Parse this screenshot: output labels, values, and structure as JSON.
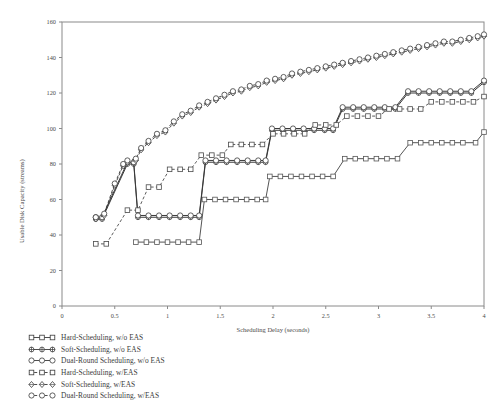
{
  "chart_data": {
    "type": "line",
    "title": "",
    "xlabel": "Scheduling Delay (seconds)",
    "ylabel": "Usable Disk Capacity (streams)",
    "xlim": [
      0,
      4
    ],
    "ylim": [
      0,
      160
    ],
    "xticks": [
      "0",
      "0.5",
      "1",
      "1.5",
      "2",
      "2.5",
      "3",
      "3.5",
      "4"
    ],
    "xtick_values": [
      0,
      0.5,
      1,
      1.5,
      2,
      2.5,
      3,
      3.5,
      4
    ],
    "yticks": [
      "0",
      "20",
      "40",
      "60",
      "80",
      "100",
      "120",
      "140",
      "160"
    ],
    "ytick_values": [
      0,
      20,
      40,
      60,
      80,
      100,
      120,
      140,
      160
    ],
    "grid": false,
    "legend_position": "below-plot-left",
    "series": [
      {
        "name": "Hard-Scheduling, w/o EAS",
        "marker": "square",
        "line": "solid",
        "color": "#555555",
        "points": [
          [
            0.7,
            36
          ],
          [
            0.8,
            36
          ],
          [
            0.9,
            36
          ],
          [
            1.0,
            36
          ],
          [
            1.1,
            36
          ],
          [
            1.2,
            36
          ],
          [
            1.3,
            36
          ],
          [
            1.35,
            60
          ],
          [
            1.45,
            60
          ],
          [
            1.55,
            60
          ],
          [
            1.65,
            60
          ],
          [
            1.75,
            60
          ],
          [
            1.85,
            60
          ],
          [
            1.93,
            60
          ],
          [
            1.97,
            73
          ],
          [
            2.07,
            73
          ],
          [
            2.17,
            73
          ],
          [
            2.27,
            73
          ],
          [
            2.37,
            73
          ],
          [
            2.47,
            73
          ],
          [
            2.57,
            73
          ],
          [
            2.68,
            83
          ],
          [
            2.78,
            83
          ],
          [
            2.88,
            83
          ],
          [
            2.98,
            83
          ],
          [
            3.08,
            83
          ],
          [
            3.18,
            83
          ],
          [
            3.3,
            92
          ],
          [
            3.4,
            92
          ],
          [
            3.5,
            92
          ],
          [
            3.6,
            92
          ],
          [
            3.7,
            92
          ],
          [
            3.8,
            92
          ],
          [
            3.92,
            92
          ],
          [
            4.0,
            98
          ]
        ]
      },
      {
        "name": "Soft-Scheduling, w/o EAS",
        "marker": "dot-plus",
        "line": "solid",
        "color": "#3a3a3a",
        "points": [
          [
            0.32,
            49
          ],
          [
            0.38,
            49
          ],
          [
            0.62,
            80
          ],
          [
            0.68,
            80
          ],
          [
            0.72,
            50
          ],
          [
            0.82,
            50
          ],
          [
            0.92,
            50
          ],
          [
            1.02,
            50
          ],
          [
            1.12,
            50
          ],
          [
            1.22,
            50
          ],
          [
            1.3,
            50
          ],
          [
            1.36,
            81
          ],
          [
            1.46,
            81
          ],
          [
            1.56,
            81
          ],
          [
            1.66,
            81
          ],
          [
            1.76,
            81
          ],
          [
            1.86,
            81
          ],
          [
            1.93,
            81
          ],
          [
            1.99,
            99
          ],
          [
            2.09,
            99
          ],
          [
            2.19,
            99
          ],
          [
            2.29,
            99
          ],
          [
            2.39,
            99
          ],
          [
            2.49,
            99
          ],
          [
            2.57,
            99
          ],
          [
            2.66,
            111
          ],
          [
            2.76,
            111
          ],
          [
            2.86,
            111
          ],
          [
            2.96,
            111
          ],
          [
            3.06,
            111
          ],
          [
            3.16,
            111
          ],
          [
            3.28,
            120
          ],
          [
            3.38,
            120
          ],
          [
            3.48,
            120
          ],
          [
            3.58,
            120
          ],
          [
            3.68,
            120
          ],
          [
            3.78,
            120
          ],
          [
            3.88,
            120
          ],
          [
            4.0,
            126
          ]
        ]
      },
      {
        "name": "Dual-Round Scheduling, w/o EAS",
        "marker": "circle",
        "line": "solid",
        "color": "#3a3a3a",
        "points": [
          [
            0.32,
            50
          ],
          [
            0.38,
            50
          ],
          [
            0.62,
            81
          ],
          [
            0.68,
            81
          ],
          [
            0.72,
            51
          ],
          [
            0.82,
            51
          ],
          [
            0.92,
            51
          ],
          [
            1.02,
            51
          ],
          [
            1.12,
            51
          ],
          [
            1.22,
            51
          ],
          [
            1.3,
            51
          ],
          [
            1.36,
            82
          ],
          [
            1.46,
            82
          ],
          [
            1.56,
            82
          ],
          [
            1.66,
            82
          ],
          [
            1.76,
            82
          ],
          [
            1.86,
            82
          ],
          [
            1.93,
            82
          ],
          [
            1.99,
            100
          ],
          [
            2.09,
            100
          ],
          [
            2.19,
            100
          ],
          [
            2.29,
            100
          ],
          [
            2.39,
            100
          ],
          [
            2.49,
            100
          ],
          [
            2.57,
            100
          ],
          [
            2.66,
            112
          ],
          [
            2.76,
            112
          ],
          [
            2.86,
            112
          ],
          [
            2.96,
            112
          ],
          [
            3.06,
            112
          ],
          [
            3.16,
            112
          ],
          [
            3.28,
            121
          ],
          [
            3.38,
            121
          ],
          [
            3.48,
            121
          ],
          [
            3.58,
            121
          ],
          [
            3.68,
            121
          ],
          [
            3.78,
            121
          ],
          [
            3.88,
            121
          ],
          [
            4.0,
            127
          ]
        ]
      },
      {
        "name": "Hard-Scheduling, w/EAS",
        "marker": "square",
        "line": "dashed",
        "color": "#4a4a4a",
        "points": [
          [
            0.32,
            35
          ],
          [
            0.42,
            35
          ],
          [
            0.62,
            54
          ],
          [
            0.72,
            54
          ],
          [
            0.82,
            67
          ],
          [
            0.92,
            67
          ],
          [
            1.02,
            77
          ],
          [
            1.12,
            77
          ],
          [
            1.22,
            77
          ],
          [
            1.32,
            85
          ],
          [
            1.42,
            85
          ],
          [
            1.52,
            85
          ],
          [
            1.6,
            91
          ],
          [
            1.7,
            91
          ],
          [
            1.8,
            91
          ],
          [
            1.9,
            91
          ],
          [
            2.0,
            97
          ],
          [
            2.1,
            97
          ],
          [
            2.2,
            97
          ],
          [
            2.3,
            97
          ],
          [
            2.4,
            102
          ],
          [
            2.5,
            102
          ],
          [
            2.6,
            102
          ],
          [
            2.7,
            107
          ],
          [
            2.8,
            107
          ],
          [
            2.9,
            107
          ],
          [
            3.0,
            107
          ],
          [
            3.1,
            111
          ],
          [
            3.2,
            111
          ],
          [
            3.3,
            111
          ],
          [
            3.4,
            111
          ],
          [
            3.5,
            115
          ],
          [
            3.6,
            115
          ],
          [
            3.7,
            115
          ],
          [
            3.8,
            115
          ],
          [
            3.9,
            115
          ],
          [
            4.0,
            118
          ]
        ]
      },
      {
        "name": "Soft-Scheduling, w/EAS",
        "marker": "diamond",
        "line": "dashed",
        "color": "#3a3a3a",
        "points": [
          [
            0.32,
            49
          ],
          [
            0.4,
            51
          ],
          [
            0.5,
            68
          ],
          [
            0.58,
            79
          ],
          [
            0.62,
            81
          ],
          [
            0.7,
            82
          ],
          [
            0.75,
            88
          ],
          [
            0.82,
            92
          ],
          [
            0.9,
            96
          ],
          [
            0.98,
            98
          ],
          [
            1.06,
            103
          ],
          [
            1.14,
            107
          ],
          [
            1.22,
            109
          ],
          [
            1.3,
            112
          ],
          [
            1.38,
            114
          ],
          [
            1.46,
            116
          ],
          [
            1.54,
            118
          ],
          [
            1.62,
            120
          ],
          [
            1.7,
            121
          ],
          [
            1.78,
            123
          ],
          [
            1.86,
            124
          ],
          [
            1.94,
            126
          ],
          [
            2.02,
            127
          ],
          [
            2.1,
            128
          ],
          [
            2.18,
            130
          ],
          [
            2.26,
            131
          ],
          [
            2.34,
            132
          ],
          [
            2.42,
            133
          ],
          [
            2.5,
            134
          ],
          [
            2.58,
            135
          ],
          [
            2.66,
            136
          ],
          [
            2.74,
            137
          ],
          [
            2.82,
            138
          ],
          [
            2.9,
            139
          ],
          [
            2.98,
            140
          ],
          [
            3.06,
            141
          ],
          [
            3.14,
            142
          ],
          [
            3.22,
            143
          ],
          [
            3.3,
            144
          ],
          [
            3.38,
            145
          ],
          [
            3.46,
            146
          ],
          [
            3.54,
            147
          ],
          [
            3.62,
            148
          ],
          [
            3.7,
            148
          ],
          [
            3.78,
            149
          ],
          [
            3.86,
            150
          ],
          [
            3.94,
            151
          ],
          [
            4.0,
            152
          ]
        ]
      },
      {
        "name": "Dual-Round Scheduling, w/EAS",
        "marker": "circle",
        "line": "dashed",
        "color": "#3a3a3a",
        "points": [
          [
            0.32,
            50
          ],
          [
            0.4,
            52
          ],
          [
            0.5,
            69
          ],
          [
            0.58,
            80
          ],
          [
            0.62,
            82
          ],
          [
            0.7,
            83
          ],
          [
            0.75,
            89
          ],
          [
            0.82,
            93
          ],
          [
            0.9,
            97
          ],
          [
            0.98,
            99
          ],
          [
            1.06,
            104
          ],
          [
            1.14,
            108
          ],
          [
            1.22,
            110
          ],
          [
            1.3,
            113
          ],
          [
            1.38,
            115
          ],
          [
            1.46,
            117
          ],
          [
            1.54,
            119
          ],
          [
            1.62,
            121
          ],
          [
            1.7,
            122
          ],
          [
            1.78,
            124
          ],
          [
            1.86,
            125
          ],
          [
            1.94,
            127
          ],
          [
            2.02,
            128
          ],
          [
            2.1,
            129
          ],
          [
            2.18,
            131
          ],
          [
            2.26,
            132
          ],
          [
            2.34,
            133
          ],
          [
            2.42,
            134
          ],
          [
            2.5,
            135
          ],
          [
            2.58,
            136
          ],
          [
            2.66,
            137
          ],
          [
            2.74,
            138
          ],
          [
            2.82,
            139
          ],
          [
            2.9,
            140
          ],
          [
            2.98,
            141
          ],
          [
            3.06,
            142
          ],
          [
            3.14,
            143
          ],
          [
            3.22,
            144
          ],
          [
            3.3,
            145
          ],
          [
            3.38,
            146
          ],
          [
            3.46,
            147
          ],
          [
            3.54,
            148
          ],
          [
            3.62,
            149
          ],
          [
            3.7,
            149
          ],
          [
            3.78,
            150
          ],
          [
            3.86,
            151
          ],
          [
            3.94,
            152
          ],
          [
            4.0,
            153
          ]
        ]
      }
    ]
  },
  "legend": {
    "items": [
      {
        "label": "Hard-Scheduling, w/o EAS",
        "marker": "square",
        "line": "solid"
      },
      {
        "label": "Soft-Scheduling, w/o EAS",
        "marker": "dot-plus",
        "line": "solid"
      },
      {
        "label": "Dual-Round Scheduling, w/o EAS",
        "marker": "circle",
        "line": "solid"
      },
      {
        "label": "Hard-Scheduling, w/EAS",
        "marker": "square",
        "line": "dashed"
      },
      {
        "label": "Soft-Scheduling, w/EAS",
        "marker": "diamond",
        "line": "dashed"
      },
      {
        "label": "Dual-Round Scheduling, w/EAS",
        "marker": "circle",
        "line": "dashed"
      }
    ]
  }
}
